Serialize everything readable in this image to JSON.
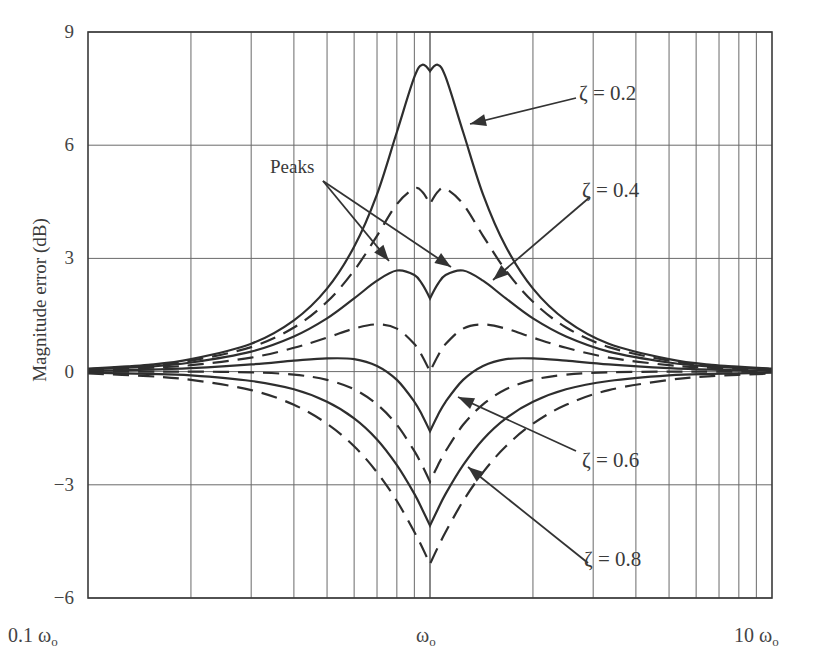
{
  "chart_data": {
    "type": "line",
    "title": "",
    "xlabel": "",
    "ylabel": "Magnitude error (dB)",
    "xscale": "log",
    "xlim": [
      0.1,
      10
    ],
    "ylim": [
      -6,
      9
    ],
    "grid": true,
    "x_ticks": [
      {
        "value": 0.1,
        "label": "0.1 ω",
        "sub": "o"
      },
      {
        "value": 1,
        "label": "ω",
        "sub": "o"
      },
      {
        "value": 10,
        "label": "10 ω",
        "sub": "o"
      }
    ],
    "y_ticks": [
      9,
      6,
      3,
      0,
      -3,
      -6
    ],
    "y_tick_labels": [
      "9",
      "6",
      "3",
      "0",
      "−3",
      "−6"
    ],
    "x_grid": [
      0.2,
      0.3,
      0.4,
      0.5,
      0.6,
      0.7,
      0.8,
      0.9,
      1,
      2,
      3,
      4,
      5,
      6,
      7,
      8,
      9
    ],
    "x_units": "ω/ωo",
    "x": [
      0.1,
      0.15,
      0.2,
      0.3,
      0.4,
      0.5,
      0.6,
      0.7,
      0.8,
      0.9,
      0.95,
      1.0,
      1.0526,
      1.1111,
      1.25,
      1.4286,
      1.6667,
      2.0,
      2.5,
      3.3333,
      5.0,
      6.6667,
      10.0
    ],
    "series": [
      {
        "name": "ζ = 0.2",
        "zeta": 0.2,
        "style": "solid",
        "labeled": true,
        "values": [
          0.08,
          0.18,
          0.33,
          0.74,
          1.36,
          2.2,
          3.31,
          4.7,
          6.35,
          7.81,
          8.13,
          7.96,
          8.13,
          7.81,
          6.35,
          4.7,
          3.31,
          2.2,
          1.36,
          0.74,
          0.33,
          0.18,
          0.08
        ]
      },
      {
        "name": "ζ = 0.3",
        "zeta": 0.3,
        "style": "dashed",
        "labeled": false,
        "values": [
          0.07,
          0.16,
          0.29,
          0.65,
          1.17,
          1.85,
          2.68,
          3.6,
          4.44,
          4.85,
          4.76,
          4.44,
          4.76,
          4.85,
          4.44,
          3.6,
          2.68,
          1.85,
          1.17,
          0.65,
          0.29,
          0.16,
          0.07
        ]
      },
      {
        "name": "ζ = 0.4",
        "zeta": 0.4,
        "style": "solid",
        "labeled": true,
        "values": [
          0.06,
          0.13,
          0.24,
          0.53,
          0.93,
          1.41,
          1.94,
          2.41,
          2.68,
          2.56,
          2.31,
          1.94,
          2.31,
          2.56,
          2.68,
          2.41,
          1.94,
          1.41,
          0.93,
          0.53,
          0.24,
          0.13,
          0.06
        ]
      },
      {
        "name": "ζ = 0.5",
        "zeta": 0.5,
        "style": "dashed",
        "labeled": false,
        "values": [
          0.04,
          0.1,
          0.17,
          0.37,
          0.63,
          0.9,
          1.14,
          1.25,
          1.14,
          0.73,
          0.4,
          0.0,
          0.4,
          0.73,
          1.14,
          1.25,
          1.14,
          0.9,
          0.63,
          0.37,
          0.17,
          0.1,
          0.04
        ]
      },
      {
        "name": "ζ = 0.6",
        "zeta": 0.6,
        "style": "solid",
        "labeled": true,
        "values": [
          0.02,
          0.05,
          0.09,
          0.19,
          0.29,
          0.35,
          0.33,
          0.15,
          -0.22,
          -0.8,
          -1.17,
          -1.58,
          -1.17,
          -0.8,
          -0.22,
          0.15,
          0.33,
          0.35,
          0.29,
          0.19,
          0.09,
          0.05,
          0.02
        ]
      },
      {
        "name": "ζ = 0.7",
        "zeta": 0.7,
        "style": "dashed",
        "labeled": false,
        "values": [
          0.0,
          0.0,
          0.0,
          -0.02,
          -0.08,
          -0.22,
          -0.47,
          -0.87,
          -1.41,
          -2.11,
          -2.5,
          -2.92,
          -2.5,
          -2.11,
          -1.41,
          -0.87,
          -0.47,
          -0.22,
          -0.08,
          -0.02,
          0.0,
          0.0,
          0.0
        ]
      },
      {
        "name": "ζ = 0.8",
        "zeta": 0.8,
        "style": "solid",
        "labeled": true,
        "values": [
          -0.03,
          -0.06,
          -0.1,
          -0.25,
          -0.47,
          -0.8,
          -1.24,
          -1.8,
          -2.48,
          -3.24,
          -3.66,
          -4.08,
          -3.66,
          -3.24,
          -2.48,
          -1.8,
          -1.24,
          -0.8,
          -0.47,
          -0.25,
          -0.1,
          -0.06,
          -0.03
        ]
      },
      {
        "name": "ζ = 0.9",
        "zeta": 0.9,
        "style": "dashed",
        "labeled": false,
        "values": [
          -0.05,
          -0.12,
          -0.22,
          -0.49,
          -0.88,
          -1.38,
          -1.98,
          -2.67,
          -3.43,
          -4.25,
          -4.67,
          -5.1,
          -4.67,
          -4.25,
          -3.43,
          -2.67,
          -1.98,
          -1.38,
          -0.88,
          -0.49,
          -0.22,
          -0.12,
          -0.05
        ]
      }
    ],
    "annotations": [
      {
        "text": "Peaks",
        "x": 270,
        "y": 157,
        "arrows": [
          [
            323,
            181,
            389,
            261
          ],
          [
            323,
            181,
            451,
            267
          ]
        ]
      },
      {
        "text": "ζ = 0.2",
        "x": 579,
        "y": 83,
        "arrows": [
          [
            576,
            98,
            470,
            124
          ]
        ]
      },
      {
        "text": "ζ = 0.4",
        "x": 582,
        "y": 180,
        "arrows": [
          [
            590,
            197,
            493,
            280
          ]
        ]
      },
      {
        "text": "ζ = 0.6",
        "x": 582,
        "y": 450,
        "arrows": [
          [
            576,
            451,
            458,
            397
          ]
        ]
      },
      {
        "text": "ζ = 0.8",
        "x": 584,
        "y": 549,
        "arrows": [
          [
            588,
            563,
            468,
            467
          ]
        ]
      }
    ],
    "layout": {
      "plot_left": 88,
      "plot_right": 772,
      "plot_top": 32,
      "plot_bottom": 598,
      "legend": "none",
      "line_color": "#2e2e2e",
      "grid_color": "#6a6a6a"
    }
  }
}
